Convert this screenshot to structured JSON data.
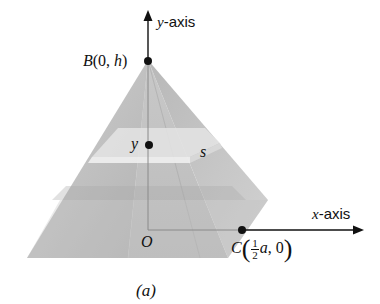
{
  "figure": {
    "caption": "(a)",
    "y_axis_label_var": "y",
    "y_axis_label_suffix": "-axis",
    "x_axis_label_var": "x",
    "x_axis_label_suffix": "-axis",
    "origin_label": "O",
    "apex_point": {
      "name": "B",
      "open": "(0, ",
      "var": "h",
      "close": ")"
    },
    "base_point": {
      "name": "C",
      "frac_num": "1",
      "frac_den": "2",
      "var": "a",
      "rest": ", 0"
    },
    "cross_section_height_label": "y",
    "cross_section_side_label": "s"
  },
  "colors": {
    "axis": "#111111",
    "pyramid_light": "#d6d6d6",
    "pyramid_mid": "#bdbdbd",
    "pyramid_dark": "#a8a8a8",
    "slab": "#e6e6e6"
  }
}
